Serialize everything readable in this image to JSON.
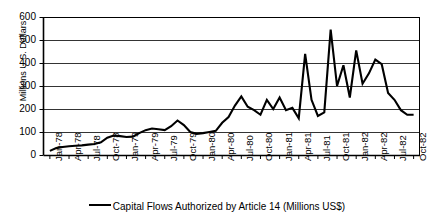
{
  "chart_data": {
    "type": "line",
    "title": "",
    "xlabel": "",
    "ylabel": "Millions U.S. Dollars",
    "ylim": [
      0,
      600
    ],
    "yticks": [
      0,
      100,
      200,
      300,
      400,
      500,
      600
    ],
    "grid": true,
    "legend_position": "bottom",
    "series": [
      {
        "name": "Capital Flows Authorized by Article 14 (Millions US$)",
        "color": "#000000",
        "values": [
          18,
          30,
          35,
          38,
          40,
          42,
          45,
          48,
          55,
          75,
          85,
          82,
          78,
          80,
          95,
          108,
          115,
          112,
          108,
          125,
          150,
          130,
          100,
          92,
          95,
          100,
          105,
          140,
          165,
          215,
          255,
          210,
          195,
          175,
          240,
          200,
          250,
          195,
          205,
          160,
          440,
          240,
          170,
          185,
          545,
          300,
          390,
          250,
          455,
          310,
          355,
          415,
          395,
          270,
          240,
          195,
          175,
          175
        ]
      }
    ],
    "x_months": [
      "Jan-78",
      "Feb-78",
      "Mar-78",
      "Apr-78",
      "May-78",
      "Jun-78",
      "Jul-78",
      "Aug-78",
      "Sep-78",
      "Oct-78",
      "Nov-78",
      "Dec-78",
      "Jan-79",
      "Feb-79",
      "Mar-79",
      "Apr-79",
      "May-79",
      "Jun-79",
      "Jul-79",
      "Aug-79",
      "Sep-79",
      "Oct-79",
      "Nov-79",
      "Dec-79",
      "Jan-80",
      "Feb-80",
      "Mar-80",
      "Apr-80",
      "May-80",
      "Jun-80",
      "Jul-80",
      "Aug-80",
      "Sep-80",
      "Oct-80",
      "Nov-80",
      "Dec-80",
      "Jan-81",
      "Feb-81",
      "Mar-81",
      "Apr-81",
      "May-81",
      "Jun-81",
      "Jul-81",
      "Aug-81",
      "Sep-81",
      "Oct-81",
      "Nov-81",
      "Dec-81",
      "Jan-82",
      "Feb-82",
      "Mar-82",
      "Apr-82",
      "May-82",
      "Jun-82",
      "Jul-82",
      "Aug-82",
      "Sep-82",
      "Oct-82"
    ],
    "xticks": [
      "Jan-78",
      "Apr-78",
      "Jul-78",
      "Oct-78",
      "Jan-79",
      "Apr-79",
      "Jul-79",
      "Oct-79",
      "Jan-80",
      "Apr-80",
      "Jul-80",
      "Oct-80",
      "Jan-81",
      "Apr-81",
      "Jul-81",
      "Oct-81",
      "Jan-82",
      "Apr-82",
      "Jul-82",
      "Oct-82"
    ]
  },
  "legend": {
    "label": "Capital Flows Authorized by Article 14 (Millions US$)"
  }
}
